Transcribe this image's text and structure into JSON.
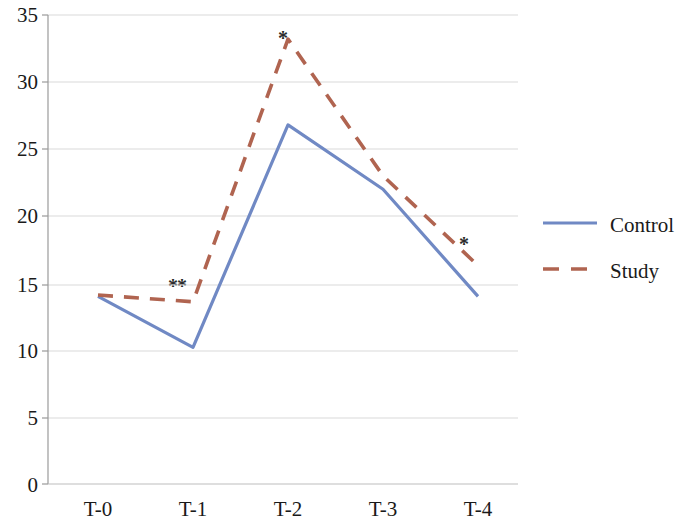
{
  "chart_data": {
    "type": "line",
    "title": "",
    "xlabel": "",
    "ylabel": "",
    "categories": [
      "T-0",
      "T-1",
      "T-2",
      "T-3",
      "T-4"
    ],
    "series": [
      {
        "name": "Control",
        "color": "#7089c4",
        "style": "solid",
        "values": [
          14.0,
          10.2,
          26.8,
          22.0,
          14.0
        ]
      },
      {
        "name": "Study",
        "color": "#b06450",
        "style": "dashed",
        "values": [
          14.1,
          13.6,
          33.2,
          23.0,
          16.3
        ]
      }
    ],
    "ylim": [
      0,
      35
    ],
    "yticks": [
      0,
      5,
      10,
      15,
      20,
      25,
      30,
      35
    ],
    "ytick_labels": [
      "0",
      "5",
      "10",
      "15",
      "20",
      "25",
      "30",
      "35"
    ],
    "grid": true,
    "grid_color": "#d9d9d9",
    "legend_position": "right",
    "annotations": [
      {
        "text": "**",
        "x_px": 168,
        "y_px": 276
      },
      {
        "text": "*",
        "x_px": 278,
        "y_px": 28
      },
      {
        "text": "*",
        "x_px": 459,
        "y_px": 234
      }
    ]
  },
  "legend": {
    "items": [
      {
        "label": "Control",
        "color": "#7089c4",
        "style": "solid"
      },
      {
        "label": "Study",
        "color": "#b06450",
        "style": "dashed"
      }
    ]
  },
  "axes": {
    "y_axis_color": "#9a9a9a",
    "x_axis_color": "#b5b5b5"
  }
}
